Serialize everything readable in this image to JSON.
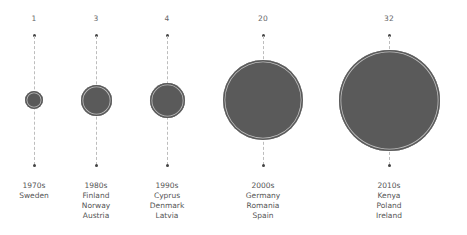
{
  "chart_data": {
    "type": "bubble",
    "title": "",
    "xlabel": "",
    "ylabel": "",
    "categories": [
      "1970s",
      "1980s",
      "1990s",
      "2000s",
      "2010s"
    ],
    "values": [
      1,
      3,
      4,
      20,
      32
    ],
    "countries": [
      [
        "Sweden"
      ],
      [
        "Finland",
        "Norway",
        "Austria"
      ],
      [
        "Cyprus",
        "Denmark",
        "Latvia"
      ],
      [
        "Germany",
        "Romania",
        "Spain"
      ],
      [
        "Kenya",
        "Poland",
        "Ireland"
      ]
    ],
    "bubble_color": "#5a5a5a",
    "ring_color": "#bfbfbf",
    "stem_style": "dashed",
    "legend": null,
    "grid": false
  },
  "columns": [
    {
      "value": "1",
      "decade": "1970s",
      "countries": [
        "Sweden"
      ],
      "cx": 34,
      "r": 9
    },
    {
      "value": "3",
      "decade": "1980s",
      "countries": [
        "Finland",
        "Norway",
        "Austria"
      ],
      "cx": 96,
      "r": 15.5
    },
    {
      "value": "4",
      "decade": "1990s",
      "countries": [
        "Cyprus",
        "Denmark",
        "Latvia"
      ],
      "cx": 167,
      "r": 17.5
    },
    {
      "value": "20",
      "decade": "2000s",
      "countries": [
        "Germany",
        "Romania",
        "Spain"
      ],
      "cx": 263,
      "r": 40
    },
    {
      "value": "32",
      "decade": "2010s",
      "countries": [
        "Kenya",
        "Poland",
        "Ireland"
      ],
      "cx": 389,
      "r": 50.5
    }
  ]
}
